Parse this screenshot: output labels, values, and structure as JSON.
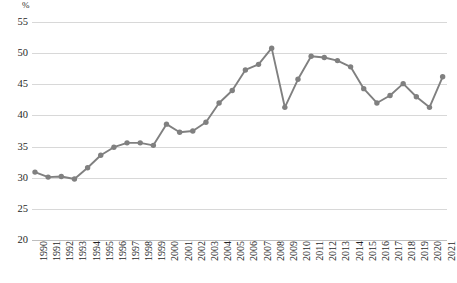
{
  "chart_data": {
    "type": "line",
    "title": "",
    "subtitle": "",
    "xlabel": "",
    "ylabel": "%",
    "unit_label": "%",
    "ylim": [
      20,
      55
    ],
    "ytick_step": 5,
    "yticks": [
      55,
      50,
      45,
      40,
      35,
      30,
      25,
      20
    ],
    "ytick_labels": [
      "55",
      "50",
      "45",
      "40",
      "35",
      "30",
      "25",
      "20"
    ],
    "grid": true,
    "grid_axis": "y",
    "legend": false,
    "legend_position": "none",
    "marker": "circle",
    "series_color": "#808080",
    "grid_color": "#d8d8d8",
    "categories": [
      "1990",
      "1991",
      "1992",
      "1993",
      "1994",
      "1995",
      "1996",
      "1997",
      "1998",
      "1999",
      "2000",
      "2001",
      "2002",
      "2003",
      "2004",
      "2005",
      "2006",
      "2007",
      "2008",
      "2009",
      "2010",
      "2011",
      "2012",
      "2013",
      "2014",
      "2015",
      "2016",
      "2017",
      "2018",
      "2019",
      "2020",
      "2021"
    ],
    "values": [
      30.9,
      30.1,
      30.2,
      29.8,
      31.6,
      33.6,
      34.9,
      35.6,
      35.6,
      35.2,
      38.6,
      37.3,
      37.5,
      38.9,
      42.0,
      44.0,
      47.3,
      48.2,
      50.8,
      41.3,
      45.8,
      49.5,
      49.3,
      48.8,
      47.8,
      44.3,
      42.0,
      43.2,
      45.1,
      43.0,
      41.3,
      46.2
    ]
  }
}
